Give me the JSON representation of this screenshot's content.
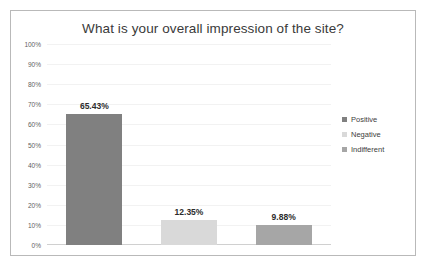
{
  "chart_data": {
    "type": "bar",
    "title": "What is your overall impression of the site?",
    "xlabel": "",
    "ylabel": "",
    "categories": [
      "Positive",
      "Negative",
      "Indifferent"
    ],
    "values": [
      65.43,
      12.35,
      9.88
    ],
    "data_labels": [
      "65.43%",
      "12.35%",
      "9.88%"
    ],
    "ylim": [
      0,
      100
    ],
    "yticks": [
      100,
      90,
      80,
      70,
      60,
      50,
      40,
      30,
      20,
      10,
      0
    ],
    "ytick_labels": [
      "100%",
      "90%",
      "80%",
      "70%",
      "60%",
      "50%",
      "40%",
      "30%",
      "20%",
      "10%",
      "0%"
    ],
    "grid": true,
    "legend_position": "right",
    "series": [
      {
        "name": "Positive",
        "value": 65.43,
        "label": "65.43%",
        "color": "#808080"
      },
      {
        "name": "Negative",
        "value": 12.35,
        "label": "12.35%",
        "color": "#d9d9d9"
      },
      {
        "name": "Indifferent",
        "value": 9.88,
        "label": "9.88%",
        "color": "#a6a6a6"
      }
    ]
  },
  "legend": {
    "items": [
      {
        "label": "Positive",
        "color": "#808080"
      },
      {
        "label": "Negative",
        "color": "#d9d9d9"
      },
      {
        "label": "Indifferent",
        "color": "#a6a6a6"
      }
    ]
  },
  "colors": {
    "frame_border": "#b9b9b9",
    "gridline": "#f2f2f2",
    "axis": "#d0d0d0",
    "title_text": "#3a3a3a",
    "tick_text": "#5f5f5f",
    "label_text": "#2c2c2c",
    "background": "#ffffff"
  }
}
